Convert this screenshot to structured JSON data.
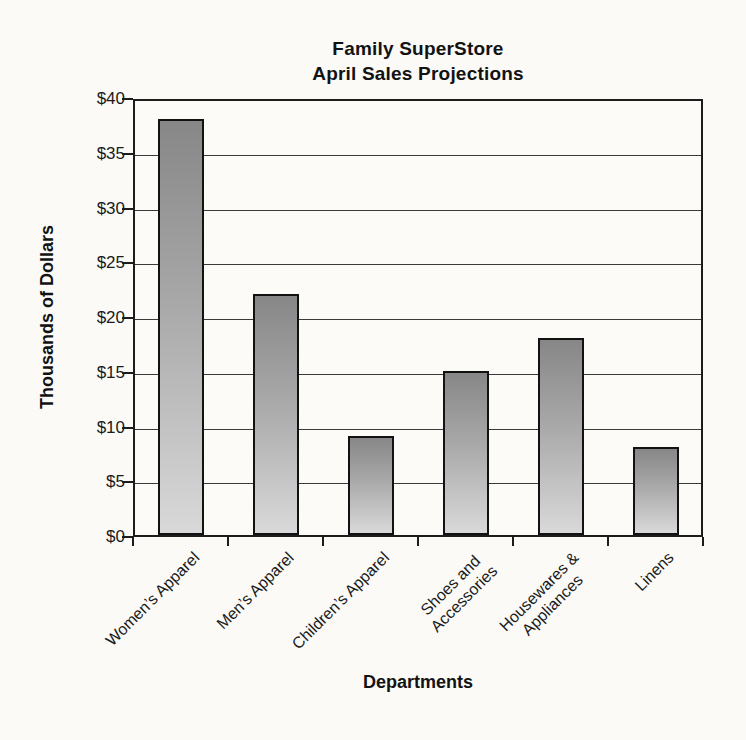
{
  "chart_data": {
    "type": "bar",
    "title_line1": "Family SuperStore",
    "title_line2": "April Sales Projections",
    "xlabel": "Departments",
    "ylabel": "Thousands of Dollars",
    "categories": [
      "Women’s Apparel",
      "Men’s Apparel",
      "Children’s Apparel",
      "Shoes and\nAccessories",
      "Housewares &\nAppliances",
      "Linens"
    ],
    "values": [
      38,
      22,
      9,
      15,
      18,
      8
    ],
    "ylim": [
      0,
      40
    ],
    "ytick_step": 5,
    "ytick_labels": [
      "$0",
      "$5",
      "$10",
      "$15",
      "$20",
      "$25",
      "$30",
      "$35",
      "$40"
    ],
    "grid": true,
    "legend": "none",
    "colors": {
      "bar_gradient_top": "#878787",
      "bar_gradient_bottom": "#d9d9d9",
      "bar_border": "#121212",
      "grid_color": "#3a3a3a",
      "axis_color": "#1c1c1c",
      "text_color": "#151515",
      "background": "#fbfaf7"
    }
  }
}
